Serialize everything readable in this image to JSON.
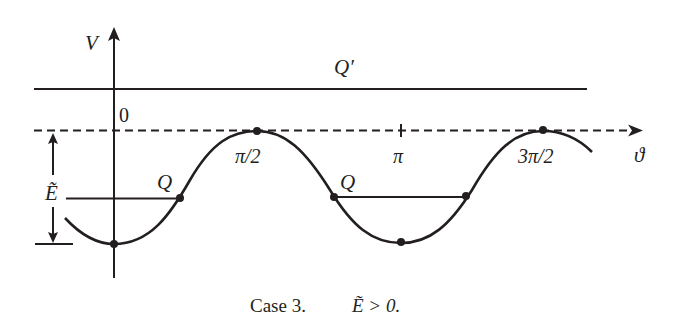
{
  "figure": {
    "axis_labels": {
      "y": "V",
      "x": "ϑ",
      "origin": "0"
    },
    "tick_labels": {
      "pi_over_2": "π/2",
      "pi": "π",
      "three_pi_over_2": "3π/2"
    },
    "level_labels": {
      "upper": "Q′",
      "lower_left": "Q",
      "lower_right": "Q",
      "energy": "Ẽ"
    },
    "caption": {
      "case": "Case 3.",
      "condition": "Ẽ > 0."
    },
    "colors": {
      "ink": "#231f20",
      "background": "#ffffff"
    }
  }
}
